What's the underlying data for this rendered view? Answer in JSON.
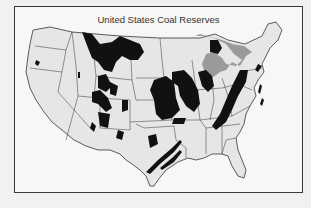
{
  "map": {
    "title": "United States Coal Reserves",
    "legend_colors": {
      "coal_reserve": "#111111",
      "great_lakes": "#9a9a9a",
      "land": "#e8e8e6",
      "border": "#333333"
    },
    "regions": [
      "Northern Great Plains",
      "Rocky Mountains",
      "Interior (Illinois Basin)",
      "Western Interior",
      "Appalachian",
      "Gulf Coast",
      "Michigan Basin"
    ]
  }
}
